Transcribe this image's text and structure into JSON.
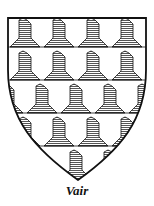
{
  "figure": {
    "caption": "Vair",
    "tincture_pattern": "vair",
    "colors": {
      "outline": "#111111",
      "argent": "#ffffff",
      "azure_hatching": "#555555",
      "hatch_bg": "#ffffff"
    },
    "rows": 5,
    "bells_per_row": 4
  }
}
